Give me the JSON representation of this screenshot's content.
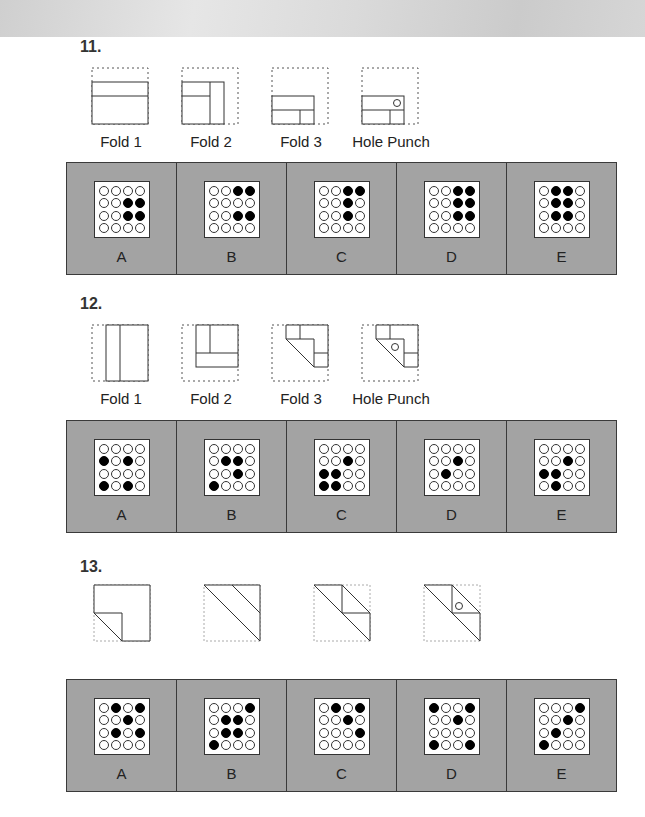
{
  "questions": [
    {
      "number": "11.",
      "fold_labels": [
        "Fold 1",
        "Fold 2",
        "Fold 3",
        "Hole Punch"
      ],
      "answers": [
        {
          "letter": "A",
          "grid": [
            [
              0,
              0,
              0,
              0
            ],
            [
              0,
              0,
              1,
              1
            ],
            [
              0,
              0,
              1,
              1
            ],
            [
              0,
              0,
              0,
              0
            ]
          ]
        },
        {
          "letter": "B",
          "grid": [
            [
              0,
              0,
              1,
              1
            ],
            [
              0,
              0,
              0,
              0
            ],
            [
              0,
              0,
              1,
              1
            ],
            [
              0,
              0,
              0,
              0
            ]
          ]
        },
        {
          "letter": "C",
          "grid": [
            [
              0,
              0,
              1,
              1
            ],
            [
              0,
              0,
              1,
              0
            ],
            [
              0,
              0,
              1,
              0
            ],
            [
              0,
              0,
              0,
              0
            ]
          ]
        },
        {
          "letter": "D",
          "grid": [
            [
              0,
              0,
              1,
              1
            ],
            [
              0,
              0,
              1,
              1
            ],
            [
              0,
              0,
              1,
              1
            ],
            [
              0,
              0,
              0,
              0
            ]
          ]
        },
        {
          "letter": "E",
          "grid": [
            [
              0,
              1,
              1,
              0
            ],
            [
              0,
              1,
              1,
              0
            ],
            [
              0,
              1,
              1,
              0
            ],
            [
              0,
              0,
              0,
              0
            ]
          ]
        }
      ]
    },
    {
      "number": "12.",
      "fold_labels": [
        "Fold 1",
        "Fold 2",
        "Fold 3",
        "Hole Punch"
      ],
      "answers": [
        {
          "letter": "A",
          "grid": [
            [
              0,
              0,
              0,
              0
            ],
            [
              1,
              0,
              1,
              0
            ],
            [
              0,
              0,
              0,
              0
            ],
            [
              1,
              0,
              1,
              0
            ]
          ]
        },
        {
          "letter": "B",
          "grid": [
            [
              0,
              0,
              0,
              0
            ],
            [
              0,
              1,
              1,
              0
            ],
            [
              0,
              0,
              1,
              0
            ],
            [
              1,
              0,
              0,
              0
            ]
          ]
        },
        {
          "letter": "C",
          "grid": [
            [
              0,
              0,
              0,
              0
            ],
            [
              0,
              0,
              1,
              0
            ],
            [
              1,
              1,
              0,
              0
            ],
            [
              1,
              1,
              0,
              0
            ]
          ]
        },
        {
          "letter": "D",
          "grid": [
            [
              0,
              0,
              0,
              0
            ],
            [
              0,
              0,
              1,
              0
            ],
            [
              0,
              1,
              0,
              0
            ],
            [
              0,
              0,
              0,
              0
            ]
          ]
        },
        {
          "letter": "E",
          "grid": [
            [
              0,
              0,
              0,
              0
            ],
            [
              0,
              0,
              1,
              0
            ],
            [
              1,
              1,
              0,
              0
            ],
            [
              0,
              1,
              0,
              0
            ]
          ]
        }
      ]
    },
    {
      "number": "13.",
      "fold_labels": [],
      "answers": [
        {
          "letter": "A",
          "grid": [
            [
              0,
              1,
              0,
              1
            ],
            [
              0,
              0,
              1,
              0
            ],
            [
              0,
              1,
              0,
              1
            ],
            [
              0,
              0,
              0,
              0
            ]
          ]
        },
        {
          "letter": "B",
          "grid": [
            [
              0,
              0,
              0,
              1
            ],
            [
              0,
              1,
              1,
              0
            ],
            [
              0,
              1,
              1,
              0
            ],
            [
              1,
              0,
              0,
              0
            ]
          ]
        },
        {
          "letter": "C",
          "grid": [
            [
              0,
              1,
              0,
              1
            ],
            [
              0,
              0,
              1,
              0
            ],
            [
              0,
              0,
              0,
              1
            ],
            [
              0,
              0,
              0,
              0
            ]
          ]
        },
        {
          "letter": "D",
          "grid": [
            [
              1,
              0,
              0,
              1
            ],
            [
              0,
              0,
              1,
              0
            ],
            [
              0,
              0,
              0,
              0
            ],
            [
              1,
              0,
              0,
              1
            ]
          ]
        },
        {
          "letter": "E",
          "grid": [
            [
              0,
              0,
              0,
              1
            ],
            [
              0,
              0,
              1,
              0
            ],
            [
              0,
              1,
              0,
              0
            ],
            [
              1,
              0,
              0,
              0
            ]
          ]
        }
      ]
    }
  ],
  "colors": {
    "panel_bg": "#a3a3a3",
    "panel_border": "#3a3a3a",
    "hole_filled": "#000000",
    "hole_empty": "#ffffff"
  }
}
